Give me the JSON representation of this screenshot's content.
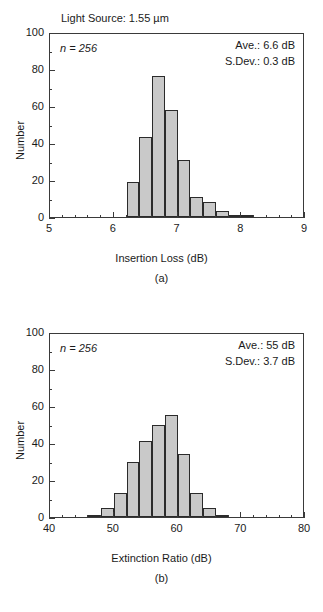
{
  "figure": {
    "background": "#ffffff",
    "bar_fill": "#c9c9c9",
    "bar_stroke": "#2b2b2b",
    "axis_color": "#3a3a3a"
  },
  "panel_a": {
    "caption": "(a)",
    "header": "Light Source:  1.55 µm",
    "n_label": "n = 256",
    "ave_label": "Ave.: 6.6 dB",
    "sdev_label": "S.Dev.: 0.3 dB"
  },
  "panel_b": {
    "caption": "(b)",
    "n_label": "n = 256",
    "ave_label": "Ave.: 55 dB",
    "sdev_label": "S.Dev.: 3.7 dB"
  },
  "chart_data": [
    {
      "type": "bar",
      "id": "insertion-loss-histogram",
      "title": "Light Source:  1.55 µm",
      "xlabel": "Insertion Loss (dB)",
      "ylabel": "Number",
      "xlim": [
        5,
        9
      ],
      "ylim": [
        0,
        100
      ],
      "xticks": [
        5,
        6,
        7,
        8,
        9
      ],
      "yticks": [
        0,
        20,
        40,
        60,
        80,
        100
      ],
      "xminor_step": 0.2,
      "yminor_step": 10,
      "grid": false,
      "legend": "none",
      "bin_width": 0.2,
      "bin_starts": [
        6.2,
        6.4,
        6.6,
        6.8,
        7.0,
        7.2,
        7.4,
        7.6,
        7.8,
        8.0
      ],
      "values": [
        19,
        43,
        76,
        58,
        31,
        11,
        8,
        3,
        1,
        1
      ],
      "annotations": [
        "n = 256",
        "Ave.: 6.6 dB",
        "S.Dev.: 0.3 dB"
      ]
    },
    {
      "type": "bar",
      "id": "extinction-ratio-histogram",
      "title": "",
      "xlabel": "Extinction Ratio (dB)",
      "ylabel": "Number",
      "xlim": [
        40,
        80
      ],
      "ylim": [
        0,
        100
      ],
      "xticks": [
        40,
        50,
        60,
        70,
        80
      ],
      "yticks": [
        0,
        20,
        40,
        60,
        80,
        100
      ],
      "xminor_step": 2,
      "yminor_step": 10,
      "grid": false,
      "legend": "none",
      "bin_width": 2,
      "bin_starts": [
        46,
        48,
        50,
        52,
        54,
        56,
        58,
        60,
        62,
        64,
        66
      ],
      "values": [
        1,
        5,
        13,
        30,
        41,
        50,
        55,
        34,
        13,
        5,
        1
      ],
      "annotations": [
        "n = 256",
        "Ave.: 55 dB",
        "S.Dev.: 3.7 dB"
      ]
    }
  ],
  "axis_titles": {
    "a_x": "Insertion Loss (dB)",
    "a_y": "Number",
    "b_x": "Extinction Ratio (dB)",
    "b_y": "Number"
  },
  "ticks": {
    "a_x": [
      "5",
      "6",
      "7",
      "8",
      "9"
    ],
    "a_y": [
      "0",
      "20",
      "40",
      "60",
      "80",
      "100"
    ],
    "b_x": [
      "40",
      "50",
      "60",
      "70",
      "80"
    ],
    "b_y": [
      "0",
      "20",
      "40",
      "60",
      "80",
      "100"
    ]
  }
}
